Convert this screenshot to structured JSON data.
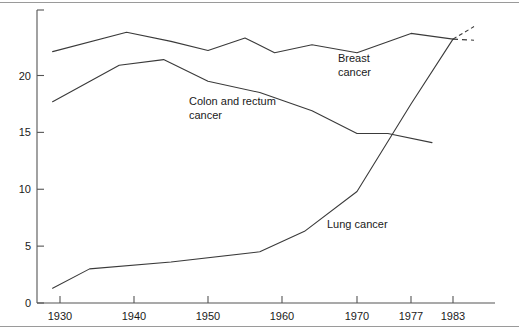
{
  "chart_data": {
    "type": "line",
    "title": "",
    "subtitle": "",
    "xlabel": "",
    "ylabel": "",
    "xlim": [
      1928,
      1986
    ],
    "ylim": [
      0,
      24.5
    ],
    "grid": false,
    "legend_position": "inline-annotations",
    "x_tick_labels": [
      "1930",
      "1940",
      "1950",
      "1960",
      "1970",
      "1977",
      "1983"
    ],
    "x_tick_values": [
      1930,
      1940,
      1950,
      1960,
      1970,
      1977,
      1983
    ],
    "y_tick_labels": [
      "0",
      "5",
      "10",
      "15",
      "20"
    ],
    "y_tick_values": [
      0,
      5,
      10,
      15,
      20
    ],
    "series": [
      {
        "name": "Breast cancer",
        "label_text_line1": "Breast",
        "label_text_line2": "cancer",
        "style": "solid",
        "x": [
          1929,
          1939,
          1945,
          1950,
          1955,
          1959,
          1964,
          1970,
          1977,
          1983
        ],
        "values": [
          22.1,
          23.8,
          23.0,
          22.2,
          23.3,
          22.0,
          22.7,
          22.0,
          23.7,
          23.2
        ]
      },
      {
        "name": "Breast cancer projection",
        "style": "dashed",
        "x": [
          1983,
          1986
        ],
        "values": [
          23.2,
          23.1
        ]
      },
      {
        "name": "Colon and rectum cancer",
        "label_text_line1": "Colon and rectum",
        "label_text_line2": "cancer",
        "style": "solid",
        "x": [
          1929,
          1938,
          1944,
          1950,
          1957,
          1964,
          1970,
          1974,
          1980
        ],
        "values": [
          17.7,
          20.9,
          21.4,
          19.5,
          18.5,
          16.9,
          14.9,
          14.9,
          14.1
        ]
      },
      {
        "name": "Lung cancer",
        "label_text_line1": "Lung cancer",
        "style": "solid",
        "x": [
          1929,
          1934,
          1945,
          1957,
          1963,
          1970,
          1977,
          1983
        ],
        "values": [
          1.3,
          3.0,
          3.6,
          4.5,
          6.3,
          9.8,
          17.5,
          23.2
        ]
      },
      {
        "name": "Lung cancer projection",
        "style": "dotted",
        "x": [
          1983,
          1986
        ],
        "values": [
          23.2,
          24.3
        ]
      }
    ],
    "annotations": [
      {
        "text": "Breast cancer",
        "x": 1973,
        "y": 21.0
      },
      {
        "text": "Colon and rectum cancer",
        "x": 1946,
        "y": 18.2
      },
      {
        "text": "Lung cancer",
        "x": 1962,
        "y": 7.0
      }
    ],
    "colors": {
      "line": "#3a3a3a",
      "axis": "#555555",
      "text": "#1a1a1a",
      "background": "#ffffff",
      "frame": "#9a9a9a"
    }
  }
}
